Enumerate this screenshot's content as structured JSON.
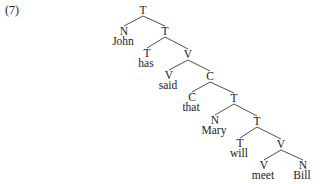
{
  "example": {
    "number": "(7)"
  },
  "tree": {
    "nodes": [
      {
        "id": "n0",
        "label": "T",
        "word": null,
        "x": 143,
        "y": 14
      },
      {
        "id": "n1",
        "label": "N",
        "word": "John",
        "x": 124,
        "y": 35
      },
      {
        "id": "n2",
        "label": "T",
        "word": null,
        "x": 165,
        "y": 35
      },
      {
        "id": "n3",
        "label": "T",
        "word": "has",
        "x": 147,
        "y": 57
      },
      {
        "id": "n4",
        "label": "V",
        "word": null,
        "x": 188,
        "y": 58
      },
      {
        "id": "n5",
        "label": "V",
        "word": "said",
        "x": 169,
        "y": 79
      },
      {
        "id": "n6",
        "label": "C",
        "word": null,
        "x": 210,
        "y": 80
      },
      {
        "id": "n7",
        "label": "C",
        "word": "that",
        "x": 192,
        "y": 101
      },
      {
        "id": "n8",
        "label": "T",
        "word": null,
        "x": 234,
        "y": 102
      },
      {
        "id": "n9",
        "label": "N",
        "word": "Mary",
        "x": 215,
        "y": 124
      },
      {
        "id": "n10",
        "label": "T",
        "word": null,
        "x": 257,
        "y": 125
      },
      {
        "id": "n11",
        "label": "T",
        "word": "will",
        "x": 240,
        "y": 147
      },
      {
        "id": "n12",
        "label": "V",
        "word": null,
        "x": 281,
        "y": 148
      },
      {
        "id": "n13",
        "label": "V",
        "word": "meet",
        "x": 264,
        "y": 169
      },
      {
        "id": "n14",
        "label": "N",
        "word": "Bill",
        "x": 303,
        "y": 169
      }
    ],
    "edges": [
      [
        "n0",
        "n1"
      ],
      [
        "n0",
        "n2"
      ],
      [
        "n2",
        "n3"
      ],
      [
        "n2",
        "n4"
      ],
      [
        "n4",
        "n5"
      ],
      [
        "n4",
        "n6"
      ],
      [
        "n6",
        "n7"
      ],
      [
        "n6",
        "n8"
      ],
      [
        "n8",
        "n9"
      ],
      [
        "n8",
        "n10"
      ],
      [
        "n10",
        "n11"
      ],
      [
        "n10",
        "n12"
      ],
      [
        "n12",
        "n13"
      ],
      [
        "n12",
        "n14"
      ]
    ]
  }
}
